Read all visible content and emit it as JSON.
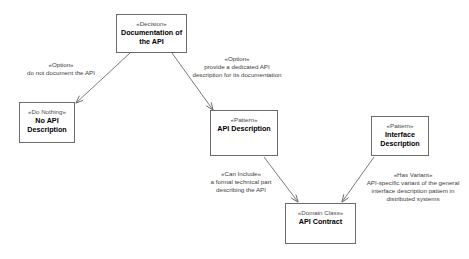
{
  "diagram": {
    "background_color": "#ffffff",
    "line_color": "#6b6b6b",
    "text_color": "#000000",
    "nodes": [
      {
        "id": "decision",
        "stereotype": "«Decision»",
        "name": "Documentation of the API",
        "x": 116,
        "y": 14,
        "w": 71,
        "h": 39
      },
      {
        "id": "do_nothing",
        "stereotype": "«Do Nothing»",
        "name": "No API Description",
        "x": 19,
        "y": 102,
        "w": 56,
        "h": 41
      },
      {
        "id": "api_description",
        "stereotype": "«Pattern»",
        "name": "API Description",
        "x": 210,
        "y": 110,
        "w": 68,
        "h": 46
      },
      {
        "id": "interface_description",
        "stereotype": "«Pattern»",
        "name": "Interface Description",
        "x": 371,
        "y": 116,
        "w": 58,
        "h": 40
      },
      {
        "id": "api_contract",
        "stereotype": "«Domain Class»",
        "name": "API Contract",
        "x": 285,
        "y": 203,
        "w": 71,
        "h": 41
      }
    ],
    "edges": [
      {
        "id": "edge-do-not-document",
        "from": "decision",
        "to": "do_nothing",
        "stereotype": "«Option»",
        "text": "do not document the API",
        "label_x": 13,
        "label_y": 61,
        "label_w": 96
      },
      {
        "id": "edge-provide-description",
        "from": "decision",
        "to": "api_description",
        "stereotype": "«Option»",
        "text": "provide a dedicated API description for its documentation",
        "label_x": 190,
        "label_y": 55,
        "label_w": 94
      },
      {
        "id": "edge-can-include",
        "from": "api_description",
        "to": "api_contract",
        "stereotype": "«Can Include»",
        "text": "a formal technical part describing the API",
        "label_x": 196,
        "label_y": 170,
        "label_w": 90
      },
      {
        "id": "edge-has-variant",
        "from": "interface_description",
        "to": "api_contract",
        "stereotype": "«Has Variant»",
        "text": "API-specific variant of the general interface description pattern in distributed systems",
        "label_x": 359,
        "label_y": 171,
        "label_w": 108
      }
    ]
  }
}
